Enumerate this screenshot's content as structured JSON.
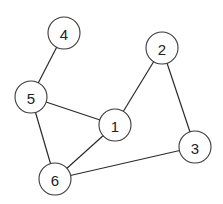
{
  "graph": {
    "nodes": [
      {
        "id": "1",
        "label": "1",
        "x": 115,
        "y": 125
      },
      {
        "id": "2",
        "label": "2",
        "x": 162,
        "y": 48
      },
      {
        "id": "3",
        "label": "3",
        "x": 195,
        "y": 147
      },
      {
        "id": "4",
        "label": "4",
        "x": 64,
        "y": 33
      },
      {
        "id": "5",
        "label": "5",
        "x": 31,
        "y": 97
      },
      {
        "id": "6",
        "label": "6",
        "x": 55,
        "y": 179
      }
    ],
    "edges": [
      {
        "from": "4",
        "to": "5"
      },
      {
        "from": "5",
        "to": "1"
      },
      {
        "from": "5",
        "to": "6"
      },
      {
        "from": "1",
        "to": "2"
      },
      {
        "from": "1",
        "to": "6"
      },
      {
        "from": "2",
        "to": "3"
      },
      {
        "from": "3",
        "to": "6"
      }
    ],
    "node_radius": 16
  }
}
